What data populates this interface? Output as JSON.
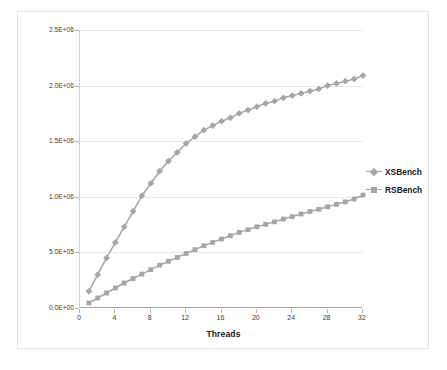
{
  "chart_data": {
    "type": "line",
    "title": "",
    "xlabel": "Threads",
    "ylabel": "Cross Section Lookups/sec",
    "xlim": [
      0,
      32
    ],
    "ylim": [
      0,
      2500000
    ],
    "grid": true,
    "legend_position": "right",
    "xticks": [
      "0",
      "4",
      "8",
      "12",
      "16",
      "20",
      "24",
      "28",
      "32"
    ],
    "xtick_values": [
      0,
      4,
      8,
      12,
      16,
      20,
      24,
      28,
      32
    ],
    "yticks": [
      "0.0E+00",
      "5.0E+05",
      "1.0E+06",
      "1.5E+06",
      "2.0E+06",
      "2.5E+06"
    ],
    "ytick_values": [
      0,
      500000,
      1000000,
      1500000,
      2000000,
      2500000
    ],
    "x": [
      1,
      2,
      3,
      4,
      5,
      6,
      7,
      8,
      9,
      10,
      11,
      12,
      13,
      14,
      15,
      16,
      17,
      18,
      19,
      20,
      21,
      22,
      23,
      24,
      25,
      26,
      27,
      28,
      29,
      30,
      31,
      32
    ],
    "series": [
      {
        "name": "XSBench",
        "color": "#a6a6a6",
        "marker": "diamond",
        "values": [
          150000,
          300000,
          450000,
          590000,
          730000,
          870000,
          1010000,
          1120000,
          1230000,
          1320000,
          1400000,
          1480000,
          1540000,
          1600000,
          1640000,
          1680000,
          1710000,
          1750000,
          1780000,
          1810000,
          1840000,
          1860000,
          1890000,
          1910000,
          1930000,
          1950000,
          1970000,
          2000000,
          2020000,
          2040000,
          2060000,
          2090000
        ]
      },
      {
        "name": "RSBench",
        "color": "#a6a6a6",
        "marker": "square",
        "values": [
          45000,
          90000,
          135000,
          180000,
          225000,
          265000,
          305000,
          345000,
          385000,
          420000,
          455000,
          490000,
          525000,
          560000,
          590000,
          620000,
          650000,
          680000,
          705000,
          730000,
          752000,
          775000,
          800000,
          822000,
          845000,
          868000,
          888000,
          910000,
          932000,
          955000,
          980000,
          1016000
        ]
      }
    ]
  },
  "axis": {
    "ylabel": "Cross Section Lookups/sec",
    "xlabel": "Threads"
  },
  "legend": {
    "items": [
      {
        "label": "XSBench"
      },
      {
        "label": "RSBench"
      }
    ]
  }
}
